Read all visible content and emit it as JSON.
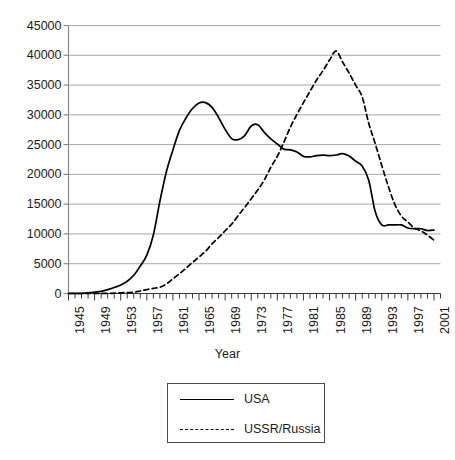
{
  "chart_data": {
    "type": "line",
    "title": "",
    "xlabel": "Year",
    "ylabel": "",
    "xlim": [
      1945,
      2002
    ],
    "ylim": [
      0,
      45000
    ],
    "grid": true,
    "legend_position": "below-plot",
    "y_ticks": [
      0,
      5000,
      10000,
      15000,
      20000,
      25000,
      30000,
      35000,
      40000,
      45000
    ],
    "y_tick_labels": [
      "0",
      "5000",
      "10000",
      "15000",
      "20000",
      "25000",
      "30000",
      "35000",
      "40000",
      "45000"
    ],
    "x_ticks": [
      1945,
      1949,
      1953,
      1957,
      1961,
      1965,
      1969,
      1973,
      1977,
      1981,
      1985,
      1989,
      1993,
      1997,
      2001
    ],
    "x_tick_labels": [
      "1945",
      "1949",
      "1953",
      "1957",
      "1961",
      "1965",
      "1969",
      "1973",
      "1977",
      "1981",
      "1985",
      "1989",
      "1993",
      "1997",
      "2001"
    ],
    "x_minor_tick_step": 1,
    "x": [
      1945,
      1946,
      1947,
      1948,
      1949,
      1950,
      1951,
      1952,
      1953,
      1954,
      1955,
      1956,
      1957,
      1958,
      1959,
      1960,
      1961,
      1962,
      1963,
      1964,
      1965,
      1966,
      1967,
      1968,
      1969,
      1970,
      1971,
      1972,
      1973,
      1974,
      1975,
      1976,
      1977,
      1978,
      1979,
      1980,
      1981,
      1982,
      1983,
      1984,
      1985,
      1986,
      1987,
      1988,
      1989,
      1990,
      1991,
      1992,
      1993,
      1994,
      1995,
      1996,
      1997,
      1998,
      1999,
      2000,
      2001
    ],
    "series": [
      {
        "name": "USA",
        "style": "solid",
        "color": "#000000",
        "values": [
          6,
          11,
          32,
          110,
          235,
          369,
          640,
          1005,
          1436,
          2063,
          3057,
          4618,
          6444,
          9822,
          15468,
          20434,
          24111,
          27387,
          29459,
          31056,
          31982,
          32040,
          31255,
          29561,
          27552,
          26008,
          25830,
          26516,
          28133,
          28335,
          27052,
          25956,
          25099,
          24243,
          24107,
          23764,
          23031,
          22937,
          23154,
          23228,
          23135,
          23254,
          23490,
          23077,
          22217,
          21392,
          19008,
          13708,
          11511,
          11511,
          11511,
          11511,
          11000,
          10871,
          10871,
          10577,
          10650
        ]
      },
      {
        "name": "USSR/Russia",
        "style": "dashed",
        "color": "#000000",
        "values": [
          0,
          0,
          0,
          0,
          1,
          5,
          25,
          50,
          120,
          150,
          200,
          426,
          660,
          869,
          1060,
          1605,
          2471,
          3322,
          4238,
          5221,
          6129,
          7089,
          8339,
          9399,
          10538,
          11643,
          13092,
          14478,
          15915,
          17385,
          19055,
          21205,
          23044,
          25393,
          27935,
          30062,
          32049,
          33952,
          35804,
          37431,
          39197,
          40723,
          38859,
          37000,
          35000,
          33000,
          28595,
          25155,
          21500,
          18000,
          14978,
          13000,
          12000,
          11000,
          10500,
          9800,
          8940
        ]
      }
    ]
  },
  "axis_title": "Year",
  "legend": {
    "items": [
      {
        "label": "USA",
        "style": "solid"
      },
      {
        "label": "USSR/Russia",
        "style": "dashed"
      }
    ]
  }
}
